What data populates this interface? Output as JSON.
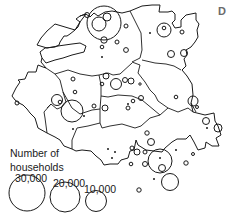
{
  "panel_label": "D",
  "legend": {
    "title_line1": "Number of",
    "title_line2": "households",
    "entries": [
      {
        "label": "30,000",
        "value": 30000
      },
      {
        "label": "20,000",
        "value": 20000
      },
      {
        "label": "10,000",
        "value": 10000
      }
    ]
  },
  "colors": {
    "line": "#1a1a1a",
    "background": "#ffffff",
    "panel_label": "#6b6b6b"
  }
}
